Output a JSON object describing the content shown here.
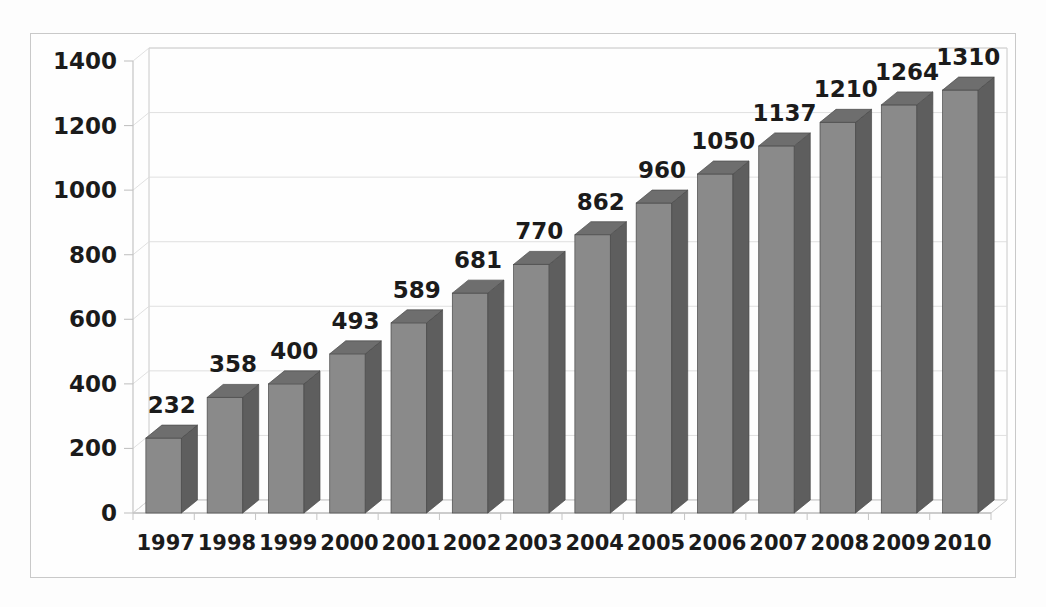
{
  "chart_data": {
    "type": "bar",
    "title": "",
    "subtitle": "",
    "xlabel": "",
    "ylabel": "",
    "categories": [
      "1997",
      "1998",
      "1999",
      "2000",
      "2001",
      "2002",
      "2003",
      "2004",
      "2005",
      "2006",
      "2007",
      "2008",
      "2009",
      "2010"
    ],
    "values": [
      232,
      358,
      400,
      493,
      589,
      681,
      770,
      862,
      960,
      1050,
      1137,
      1210,
      1264,
      1310
    ],
    "data_labels": [
      "232",
      "358",
      "400",
      "493",
      "589",
      "681",
      "770",
      "862",
      "960",
      "1050",
      "1137",
      "1210",
      "1264",
      "1310"
    ],
    "ylim": [
      0,
      1400
    ],
    "ytick_values": [
      0,
      200,
      400,
      600,
      800,
      1000,
      1200,
      1400
    ],
    "ytick_labels": [
      "0",
      "200",
      "400",
      "600",
      "800",
      "1000",
      "1200",
      "1400"
    ],
    "grid": true,
    "grid_axis": "y",
    "legend": false,
    "legend_position": "none",
    "three_d": true,
    "series": [
      {
        "name": "Series 1",
        "values": [
          232,
          358,
          400,
          493,
          589,
          681,
          770,
          862,
          960,
          1050,
          1137,
          1210,
          1264,
          1310
        ]
      }
    ]
  },
  "style": {
    "bar_front_color": "#8a8a8a",
    "bar_side_color": "#5e5e5e",
    "bar_top_color": "#6e6e6e",
    "bar_edge_color": "#4a4a4a",
    "grid_color": "#dcdcdc",
    "axis_color": "#c4c4c4",
    "frame_color": "#c9c9c9",
    "background_color": "#fefefe",
    "page_background_color": "#fdfdfd",
    "label_color": "#1b1b1b"
  }
}
